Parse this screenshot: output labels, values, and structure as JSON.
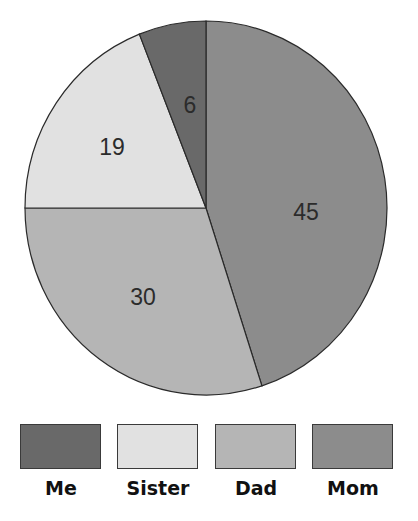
{
  "chart_data": {
    "type": "pie",
    "title": "",
    "start_angle": "12 o'clock",
    "direction": "clockwise",
    "slices": [
      {
        "label": "Mom",
        "value": 45,
        "color": "#8c8c8c"
      },
      {
        "label": "Dad",
        "value": 30,
        "color": "#b5b5b5"
      },
      {
        "label": "Sister",
        "value": 19,
        "color": "#e1e1e1"
      },
      {
        "label": "Me",
        "value": 6,
        "color": "#696969"
      }
    ],
    "data_labels": [
      "45",
      "30",
      "19",
      "6"
    ],
    "legend": {
      "position": "bottom",
      "entries": [
        {
          "label": "Me",
          "color": "#696969"
        },
        {
          "label": "Sister",
          "color": "#e1e1e1"
        },
        {
          "label": "Dad",
          "color": "#b5b5b5"
        },
        {
          "label": "Mom",
          "color": "#8c8c8c"
        }
      ]
    }
  }
}
